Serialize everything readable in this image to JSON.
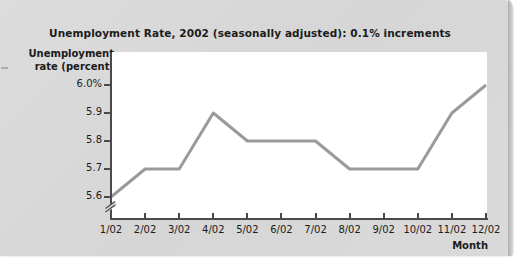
{
  "page": {
    "background_color": "#d9d9d9",
    "panel_color": "#dadada"
  },
  "chart_data": {
    "type": "line",
    "title": "Unemployment Rate, 2002 (seasonally adjusted): 0.1% increments",
    "xlabel": "Month",
    "ylabel": "Unemployment rate (percent)",
    "categories": [
      "1/02",
      "2/02",
      "3/02",
      "4/02",
      "5/02",
      "6/02",
      "7/02",
      "8/02",
      "9/02",
      "10/02",
      "11/02",
      "12/02"
    ],
    "values": [
      5.6,
      5.7,
      5.7,
      5.9,
      5.8,
      5.8,
      5.8,
      5.7,
      5.7,
      5.7,
      5.9,
      6.0
    ],
    "series": [
      {
        "name": "Unemployment rate",
        "values": [
          5.6,
          5.7,
          5.7,
          5.9,
          5.8,
          5.8,
          5.8,
          5.7,
          5.7,
          5.7,
          5.9,
          6.0
        ],
        "color": "#9a9a9a"
      }
    ],
    "ytick_labels": [
      "6.0%",
      "5.9",
      "5.8",
      "5.7",
      "5.6"
    ],
    "ytick_values": [
      6.0,
      5.9,
      5.8,
      5.7,
      5.6
    ],
    "ylim": [
      5.6,
      6.0
    ],
    "y_axis_break": true,
    "grid": false,
    "legend": "none",
    "line_color": "#9a9a9a",
    "plot_background": "#ffffff",
    "axis_color": "#4a4a4a"
  }
}
